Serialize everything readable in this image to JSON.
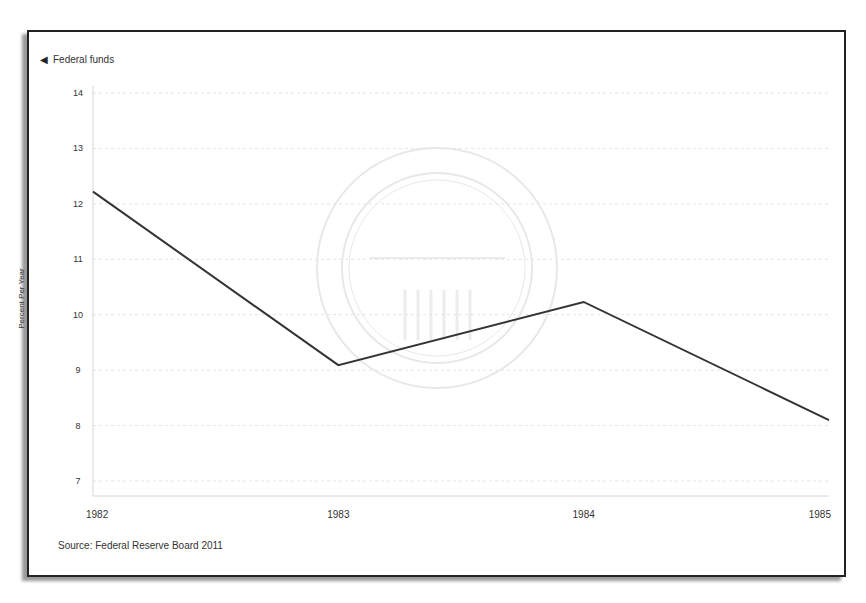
{
  "frame": {
    "legend_label": "Federal funds",
    "legend_marker_icon": "triangle-left-icon",
    "source": "Source: Federal Reserve Board 2011",
    "watermark": "BOARD OF GOVERNORS OF THE FEDERAL RESERVE SYSTEM"
  },
  "colors": {
    "line": "#333333",
    "frame_border": "#222222",
    "grid": "#e4e4e4"
  },
  "chart_data": {
    "type": "line",
    "title": "",
    "xlabel": "",
    "ylabel": "Percent Per Year",
    "x": [
      "1982",
      "1983",
      "1984",
      "1985"
    ],
    "series": [
      {
        "name": "Federal funds",
        "values": [
          12.22,
          9.09,
          10.23,
          8.1
        ]
      }
    ],
    "yticks": [
      7,
      8,
      9,
      10,
      11,
      12,
      13,
      14
    ],
    "ylim": [
      7,
      14
    ],
    "grid": true,
    "legend_position": "top-left",
    "source": "Source: Federal Reserve Board 2011"
  }
}
